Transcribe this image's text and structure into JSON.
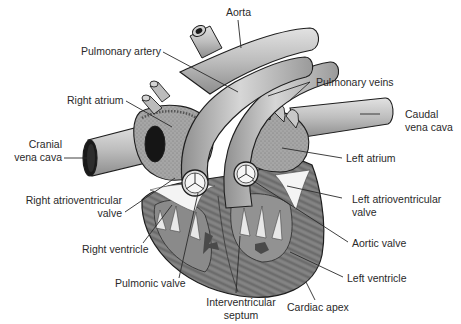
{
  "figure": {
    "labels": {
      "aorta": "Aorta",
      "pulmonary_artery": "Pulmonary artery",
      "pulmonary_veins": "Pulmonary veins",
      "right_atrium": "Right atrium",
      "caudal_vena_cava_1": "Caudal",
      "caudal_vena_cava_2": "vena cava",
      "cranial_vena_cava_1": "Cranial",
      "cranial_vena_cava_2": "vena cava",
      "left_atrium": "Left atrium",
      "right_av_valve_1": "Right atrioventricular",
      "right_av_valve_2": "valve",
      "left_av_valve_1": "Left atrioventricular",
      "left_av_valve_2": "valve",
      "right_ventricle": "Right ventricle",
      "aortic_valve": "Aortic valve",
      "pulmonic_valve": "Pulmonic valve",
      "left_ventricle": "Left ventricle",
      "interventricular_septum_1": "Interventricular",
      "interventricular_septum_2": "septum",
      "cardiac_apex": "Cardiac apex"
    },
    "colors": {
      "background": "#ffffff",
      "text": "#2a2a2a",
      "outline": "#1e1e1e",
      "vessel_fill": "#b9b9b9",
      "vessel_light": "#d8d8d8",
      "muscle_fill": "#7a7a7a",
      "chamber_fill": "#9a9a9a",
      "lumen": "#1a1a1a"
    }
  }
}
